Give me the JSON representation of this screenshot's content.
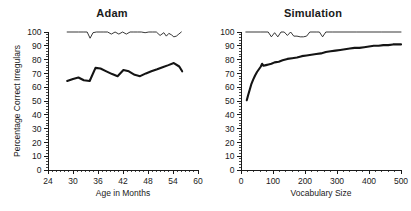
{
  "figure": {
    "background": "#ffffff",
    "line_color": "#141414",
    "text_color": "#1a1a1a"
  },
  "chart_data": [
    {
      "type": "line",
      "title": "Adam",
      "xlabel": "Age in Months",
      "ylabel": "Percentage Correct Irregulars",
      "xlim": [
        24,
        60
      ],
      "ylim": [
        0,
        100
      ],
      "xticks": [
        24,
        30,
        36,
        42,
        48,
        54,
        60
      ],
      "yticks": [
        0,
        10,
        20,
        30,
        40,
        50,
        60,
        70,
        80,
        90,
        100
      ],
      "xtick_labels": [
        "24",
        "30",
        "36",
        "42",
        "48",
        "54",
        "60"
      ],
      "ytick_labels": [
        "0",
        "10",
        "20",
        "30",
        "40",
        "50",
        "60",
        "70",
        "80",
        "90",
        "100"
      ],
      "xminor_step": 1,
      "yminor_step": 2,
      "grid": false,
      "legend": "none",
      "series": [
        {
          "name": "Percentage Correct Regulars",
          "style": "thin",
          "x": [
            28.6,
            30.0,
            31.3,
            32.6,
            33.4,
            34.1,
            34.8,
            35.6,
            36.5,
            37.4,
            38.3,
            39.2,
            40.1,
            41.0,
            41.9,
            42.8,
            43.7,
            44.6,
            45.5,
            46.4,
            47.3,
            48.2,
            49.1,
            50.0,
            50.9,
            51.8,
            52.4,
            53.0,
            53.6,
            54.2,
            54.8,
            55.4,
            56.0
          ],
          "y": [
            100,
            100,
            100,
            100,
            100,
            95.5,
            99.5,
            100,
            100,
            100,
            100,
            98.5,
            100,
            98.5,
            100,
            98.5,
            100,
            100,
            100,
            100,
            99.5,
            100,
            100,
            100,
            97.5,
            99.5,
            97.0,
            99.0,
            98.0,
            96.5,
            97.0,
            98.5,
            100
          ]
        },
        {
          "name": "Percentage Correct Irregulars",
          "style": "thick",
          "x": [
            28.6,
            30.0,
            31.3,
            32.6,
            34.0,
            35.4,
            36.6,
            38.0,
            39.4,
            40.7,
            42.1,
            43.4,
            44.8,
            46.1,
            47.5,
            48.8,
            50.2,
            51.5,
            52.9,
            54.2,
            55.5,
            56.2
          ],
          "y": [
            64.5,
            66.0,
            67.0,
            65.0,
            64.5,
            74.0,
            73.5,
            71.5,
            69.5,
            68.0,
            72.5,
            71.5,
            69.0,
            68.0,
            70.0,
            71.5,
            73.0,
            74.5,
            76.0,
            77.5,
            75.0,
            71.5
          ]
        }
      ]
    },
    {
      "type": "line",
      "title": "Simulation",
      "xlabel": "Vocabulary Size",
      "ylabel": "Percentage Correct Irregulars",
      "xlim": [
        0,
        500
      ],
      "ylim": [
        0,
        100
      ],
      "xticks": [
        0,
        100,
        200,
        300,
        400,
        500
      ],
      "yticks": [
        0,
        10,
        20,
        30,
        40,
        50,
        60,
        70,
        80,
        90,
        100
      ],
      "xtick_labels": [
        "0",
        "100",
        "200",
        "300",
        "400",
        "500"
      ],
      "ytick_labels": [
        "0",
        "10",
        "20",
        "30",
        "40",
        "50",
        "60",
        "70",
        "80",
        "90",
        "100"
      ],
      "xminor_step": 20,
      "yminor_step": 2,
      "grid": false,
      "legend": "none",
      "series": [
        {
          "name": "Percentage Correct Regulars",
          "style": "thin",
          "x": [
            15,
            60,
            85,
            95,
            105,
            115,
            125,
            135,
            145,
            155,
            165,
            175,
            185,
            195,
            205,
            215,
            225,
            235,
            245,
            255,
            265,
            275,
            285,
            300,
            360,
            440,
            500
          ],
          "y": [
            100,
            100,
            100,
            96.5,
            99.5,
            96.5,
            100,
            100,
            97.5,
            100,
            97.0,
            97.0,
            96.5,
            96.5,
            97.0,
            100,
            100,
            100,
            100,
            96.5,
            100,
            100,
            100,
            100,
            100,
            100,
            100
          ]
        },
        {
          "name": "Percentage Correct Irregulars",
          "style": "thick",
          "x": [
            18,
            22,
            27,
            32,
            38,
            44,
            50,
            56,
            62,
            66,
            70,
            78,
            86,
            95,
            105,
            118,
            130,
            145,
            160,
            175,
            190,
            205,
            220,
            235,
            250,
            265,
            280,
            295,
            310,
            325,
            340,
            355,
            370,
            385,
            400,
            415,
            430,
            445,
            460,
            475,
            490,
            500
          ],
          "y": [
            50.5,
            54.0,
            58.0,
            62.0,
            65.5,
            68.5,
            71.0,
            73.0,
            75.0,
            77.0,
            75.5,
            76.0,
            76.5,
            77.0,
            78.0,
            78.5,
            79.5,
            80.5,
            81.0,
            81.5,
            82.5,
            83.0,
            83.5,
            84.0,
            84.5,
            85.5,
            86.0,
            86.5,
            87.0,
            87.5,
            88.0,
            88.5,
            88.5,
            89.0,
            89.5,
            90.0,
            90.0,
            90.5,
            90.5,
            91.0,
            91.0,
            91.0
          ]
        }
      ]
    }
  ]
}
